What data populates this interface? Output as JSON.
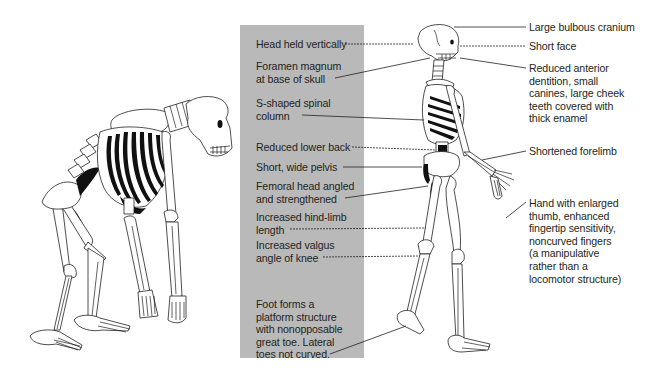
{
  "figure": {
    "left_specimen": "ape-skeleton",
    "right_specimen": "human-skeleton",
    "panel_color": "#b9b9b9",
    "line_color": "#231f20"
  },
  "left_labels": [
    {
      "id": "head-held-vertically",
      "text": "Head held vertically"
    },
    {
      "id": "foramen-magnum",
      "text": "Foramen magnum\nat base of skull"
    },
    {
      "id": "s-shaped-spine",
      "text": "S-shaped spinal\ncolumn"
    },
    {
      "id": "reduced-lower-back",
      "text": "Reduced lower back"
    },
    {
      "id": "short-wide-pelvis",
      "text": "Short, wide pelvis"
    },
    {
      "id": "femoral-head",
      "text": "Femoral head angled\nand strengthened"
    },
    {
      "id": "hind-limb-length",
      "text": "Increased hind-limb\nlength"
    },
    {
      "id": "valgus-angle",
      "text": "Increased valgus\nangle of knee"
    },
    {
      "id": "foot-platform",
      "text": "Foot forms a\nplatform structure\nwith nonopposable\ngreat toe. Lateral\ntoes not curved."
    }
  ],
  "right_labels": [
    {
      "id": "bulbous-cranium",
      "text": "Large bulbous cranium"
    },
    {
      "id": "short-face",
      "text": "Short face"
    },
    {
      "id": "reduced-dentition",
      "text": "Reduced anterior\ndentition, small\ncanines, large cheek\nteeth covered with\nthick enamel"
    },
    {
      "id": "shortened-forelimb",
      "text": "Shortened forelimb"
    },
    {
      "id": "hand",
      "text": "Hand with enlarged\nthumb, enhanced\nfingertip sensitivity,\nnoncurved fingers\n(a manipulative\nrather than a\nlocomotor structure)"
    }
  ]
}
